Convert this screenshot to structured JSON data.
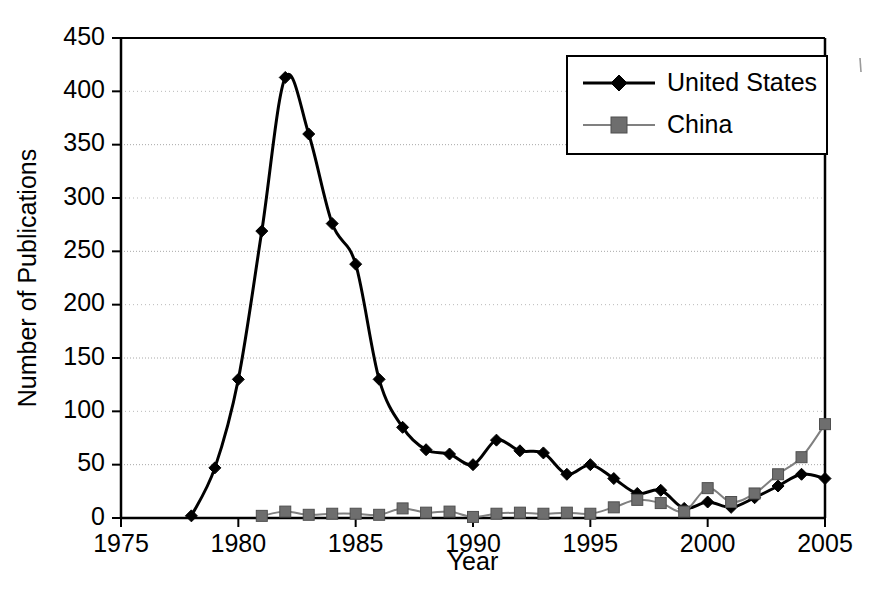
{
  "chart_data": {
    "type": "line",
    "title": "",
    "xlabel": "Year",
    "ylabel": "Number of Publications",
    "xlim": [
      1975,
      2005
    ],
    "ylim": [
      0,
      450
    ],
    "ytick_step": 50,
    "xtick_step": 5,
    "grid": "horizontal-dotted",
    "legend_position": "top-right-inside",
    "x": [
      1975,
      1976,
      1977,
      1978,
      1979,
      1980,
      1981,
      1982,
      1983,
      1984,
      1985,
      1986,
      1987,
      1988,
      1989,
      1990,
      1991,
      1992,
      1993,
      1994,
      1995,
      1996,
      1997,
      1998,
      1999,
      2000,
      2001,
      2002,
      2003,
      2004,
      2005
    ],
    "xtick_labels": [
      "1975",
      "1980",
      "1985",
      "1990",
      "1995",
      "2000",
      "2005"
    ],
    "xtick_values": [
      1975,
      1980,
      1985,
      1990,
      1995,
      2000,
      2005
    ],
    "ytick_labels": [
      "0",
      "50",
      "100",
      "150",
      "200",
      "250",
      "300",
      "350",
      "400",
      "450"
    ],
    "ytick_values": [
      0,
      50,
      100,
      150,
      200,
      250,
      300,
      350,
      400,
      450
    ],
    "series": [
      {
        "name": "United States",
        "color": "#000000",
        "marker": "diamond",
        "marker_color": "#000000",
        "line_width": 3,
        "x": [
          1978,
          1979,
          1980,
          1981,
          1982,
          1983,
          1984,
          1985,
          1986,
          1987,
          1988,
          1989,
          1990,
          1991,
          1992,
          1993,
          1994,
          1995,
          1996,
          1997,
          1998,
          1999,
          2000,
          2001,
          2002,
          2003,
          2004,
          2005
        ],
        "values": [
          2,
          47,
          130,
          269,
          413,
          360,
          276,
          238,
          130,
          85,
          64,
          60,
          50,
          73,
          63,
          61,
          41,
          50,
          37,
          23,
          26,
          9,
          15,
          10,
          19,
          30,
          41,
          37
        ]
      },
      {
        "name": "China",
        "color": "#808080",
        "marker": "square",
        "marker_color": "#6e6e6e",
        "line_width": 2,
        "x": [
          1981,
          1982,
          1983,
          1984,
          1985,
          1986,
          1987,
          1988,
          1989,
          1990,
          1991,
          1992,
          1993,
          1994,
          1995,
          1996,
          1997,
          1998,
          1999,
          2000,
          2001,
          2002,
          2003,
          2004,
          2005
        ],
        "values": [
          2,
          6,
          3,
          4,
          4,
          3,
          9,
          5,
          6,
          1,
          4,
          5,
          4,
          5,
          4,
          10,
          17,
          14,
          6,
          28,
          15,
          23,
          41,
          57,
          88
        ]
      }
    ]
  },
  "legend": {
    "entries": [
      {
        "label": "United States"
      },
      {
        "label": "China"
      }
    ]
  }
}
